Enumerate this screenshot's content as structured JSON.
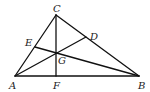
{
  "diagram": {
    "type": "triangle-cevians",
    "points": {
      "A": {
        "label": "A",
        "x": 15,
        "y": 76
      },
      "B": {
        "label": "B",
        "x": 139,
        "y": 76
      },
      "C": {
        "label": "C",
        "x": 56,
        "y": 15
      },
      "D": {
        "label": "D",
        "x": 86,
        "y": 37
      },
      "E": {
        "label": "E",
        "x": 35,
        "y": 47
      },
      "F": {
        "label": "F",
        "x": 56,
        "y": 76
      },
      "G": {
        "label": "G",
        "x": 56,
        "y": 52
      }
    },
    "segments": [
      [
        "A",
        "B"
      ],
      [
        "B",
        "C"
      ],
      [
        "C",
        "A"
      ],
      [
        "C",
        "F"
      ],
      [
        "A",
        "D"
      ],
      [
        "B",
        "E"
      ]
    ],
    "label_positions": {
      "C": {
        "x": 53,
        "y": 12
      },
      "A": {
        "x": 9,
        "y": 89
      },
      "F": {
        "x": 53,
        "y": 89
      },
      "B": {
        "x": 138,
        "y": 89
      },
      "E": {
        "x": 25,
        "y": 46
      },
      "D": {
        "x": 90,
        "y": 40
      },
      "G": {
        "x": 58,
        "y": 64
      }
    },
    "line_color": "#111111"
  }
}
